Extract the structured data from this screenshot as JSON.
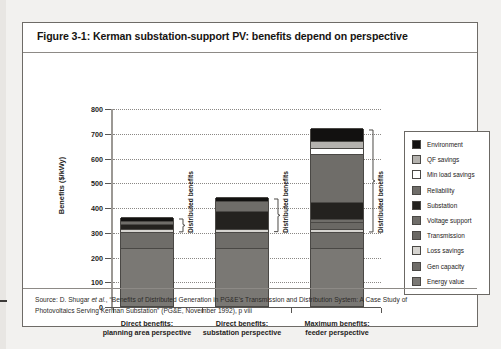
{
  "figure": {
    "title": "Figure 3-1: Kerman substation-support PV: benefits depend on perspective",
    "source_line_1_a": "Source: D. Shugar ",
    "source_line_1_it": "et al.",
    "source_line_1_b": ", “Benefits of Distributed Generation in PG&E’s Transmission and Distribution System: A Case Study of",
    "source_line_2": "Photovoltaics Serving Kerman Substation” (PG&E, November 1992), p viii"
  },
  "annotations": {
    "bracket_label_1": "Distributed benefits",
    "bracket_label_2": "Distributed benefits",
    "bracket_label_3": "Distributed benefits"
  },
  "chart_data": {
    "type": "bar",
    "subtype": "stacked",
    "title": "Kerman substation-support PV: benefits depend on perspective",
    "xlabel": "",
    "ylabel": "Benefits ($/kWy)",
    "ylim": [
      0,
      800
    ],
    "yticks": [
      0,
      100,
      200,
      300,
      400,
      500,
      600,
      700,
      800
    ],
    "ytick_labels": [
      "0",
      "100",
      "200",
      "300",
      "400",
      "500",
      "600",
      "700",
      "800"
    ],
    "grid": true,
    "legend_position": "right",
    "categories": [
      "Direct benefits:\nplanning area perspective",
      "Direct benefits:\nsubstation perspective",
      "Maximum benefits:\nfeeder perspective"
    ],
    "category_lines": [
      [
        "Direct benefits:",
        "planning area perspective"
      ],
      [
        "Direct benefits:",
        "substation perspective"
      ],
      [
        "Maximum benefits:",
        "feeder perspective"
      ]
    ],
    "series": [
      {
        "name": "Energy value",
        "color": "#7a7874",
        "values": [
          235,
          235,
          235
        ]
      },
      {
        "name": "Gen capacity",
        "color": "#6f6d69",
        "values": [
          65,
          65,
          65
        ]
      },
      {
        "name": "Loss savings",
        "color": "#d6d4d0",
        "values": [
          12,
          12,
          12
        ]
      },
      {
        "name": "Transmission",
        "color": "#6a6864",
        "values": [
          0,
          0,
          28
        ]
      },
      {
        "name": "Voltage support",
        "color": "#6f6d69",
        "values": [
          0,
          0,
          10
        ]
      },
      {
        "name": "Substation",
        "color": "#24221f",
        "values": [
          20,
          70,
          70
        ]
      },
      {
        "name": "Reliability",
        "color": "#6f6d69",
        "values": [
          12,
          42,
          195
        ]
      },
      {
        "name": "Min load savings",
        "color": "#ffffff",
        "values": [
          0,
          0,
          22
        ]
      },
      {
        "name": "QF savings",
        "color": "#b4b2ae",
        "values": [
          0,
          0,
          28
        ]
      },
      {
        "name": "Environment",
        "color": "#121110",
        "values": [
          16,
          16,
          55
        ]
      }
    ],
    "totals": [
      360,
      440,
      708
    ],
    "legend_order_top_down": [
      "Environment",
      "QF savings",
      "Min load savings",
      "Reliability",
      "Substation",
      "Voltage support",
      "Transmission",
      "Loss savings",
      "Gen capacity",
      "Energy value"
    ]
  }
}
